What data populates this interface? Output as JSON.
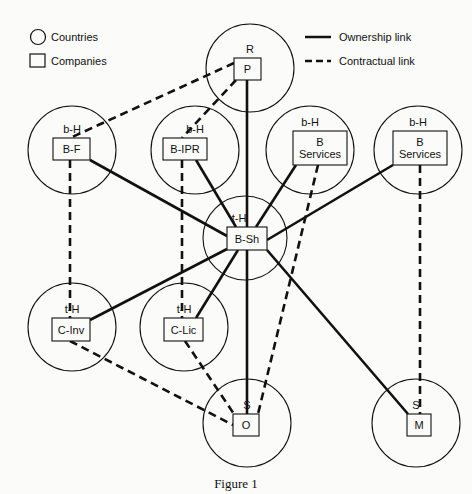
{
  "legend": {
    "countries": "Countries",
    "companies": "Companies",
    "ownership": "Ownership link",
    "contractual": "Contractual link"
  },
  "caption": "Figure 1",
  "nodes": [
    {
      "id": "P",
      "country": "R",
      "label": [
        "P"
      ],
      "cx": 250,
      "cy": 68,
      "r": 44,
      "bx": 234,
      "by": 58,
      "bw": 27,
      "bh": 22
    },
    {
      "id": "B-F",
      "country": "b-H",
      "label": [
        "B-F"
      ],
      "cx": 72,
      "cy": 150,
      "r": 44,
      "bx": 53,
      "by": 138,
      "bw": 37,
      "bh": 22
    },
    {
      "id": "B-IPR",
      "country": "b-H",
      "label": [
        "B-IPR"
      ],
      "cx": 195,
      "cy": 150,
      "r": 44,
      "bx": 163,
      "by": 138,
      "bw": 44,
      "bh": 22
    },
    {
      "id": "B-Services-1",
      "country": "b-H",
      "label": [
        "B",
        "Services"
      ],
      "cx": 310,
      "cy": 150,
      "r": 44,
      "bx": 293,
      "by": 131,
      "bw": 54,
      "bh": 34
    },
    {
      "id": "B-Services-2",
      "country": "b-H",
      "label": [
        "B",
        "Services"
      ],
      "cx": 418,
      "cy": 150,
      "r": 44,
      "bx": 393,
      "by": 131,
      "bw": 54,
      "bh": 34
    },
    {
      "id": "B-Sh",
      "country": "t-H",
      "label": [
        "B-Sh"
      ],
      "cx": 245,
      "cy": 238,
      "r": 42,
      "bx": 227,
      "by": 227,
      "bw": 40,
      "bh": 23
    },
    {
      "id": "C-Inv",
      "country": "t-H",
      "label": [
        "C-Inv"
      ],
      "cx": 72,
      "cy": 327,
      "r": 44,
      "bx": 52,
      "by": 318,
      "bw": 38,
      "bh": 23
    },
    {
      "id": "C-Lic",
      "country": "t-H",
      "label": [
        "C-Lic"
      ],
      "cx": 184,
      "cy": 327,
      "r": 44,
      "bx": 164,
      "by": 318,
      "bw": 39,
      "bh": 23
    },
    {
      "id": "O",
      "country": "S",
      "label": [
        "O"
      ],
      "cx": 247,
      "cy": 423,
      "r": 44,
      "bx": 233,
      "by": 414,
      "bw": 26,
      "bh": 22
    },
    {
      "id": "M",
      "country": "S",
      "label": [
        "M"
      ],
      "cx": 416,
      "cy": 423,
      "r": 44,
      "bx": 407,
      "by": 414,
      "bw": 24,
      "bh": 22
    }
  ],
  "links": [
    {
      "type": "ownership",
      "from": "P",
      "to": "B-Sh",
      "x1": 247,
      "y1": 80,
      "x2": 247,
      "y2": 227
    },
    {
      "type": "ownership",
      "from": "B-Sh",
      "to": "B-F",
      "x1": 227,
      "y1": 236,
      "x2": 90,
      "y2": 160
    },
    {
      "type": "ownership",
      "from": "B-Sh",
      "to": "B-IPR",
      "x1": 236,
      "y1": 227,
      "x2": 196,
      "y2": 160
    },
    {
      "type": "ownership",
      "from": "B-Sh",
      "to": "B-Services-1",
      "x1": 256,
      "y1": 227,
      "x2": 296,
      "y2": 165
    },
    {
      "type": "ownership",
      "from": "B-Sh",
      "to": "B-Services-2",
      "x1": 267,
      "y1": 240,
      "x2": 393,
      "y2": 165
    },
    {
      "type": "ownership",
      "from": "B-Sh",
      "to": "C-Inv",
      "x1": 227,
      "y1": 249,
      "x2": 90,
      "y2": 320
    },
    {
      "type": "ownership",
      "from": "B-Sh",
      "to": "C-Lic",
      "x1": 238,
      "y1": 250,
      "x2": 196,
      "y2": 318
    },
    {
      "type": "ownership",
      "from": "B-Sh",
      "to": "O",
      "x1": 247,
      "y1": 250,
      "x2": 247,
      "y2": 414
    },
    {
      "type": "ownership",
      "from": "B-Sh",
      "to": "M",
      "x1": 267,
      "y1": 250,
      "x2": 408,
      "y2": 414
    },
    {
      "type": "contractual",
      "from": "P",
      "to": "B-F",
      "x1": 234,
      "y1": 63,
      "x2": 70,
      "y2": 138
    },
    {
      "type": "contractual",
      "from": "P",
      "to": "B-IPR",
      "x1": 236,
      "y1": 80,
      "x2": 182,
      "y2": 138
    },
    {
      "type": "contractual",
      "from": "B-F",
      "to": "C-Inv",
      "x1": 70,
      "y1": 160,
      "x2": 70,
      "y2": 318
    },
    {
      "type": "contractual",
      "from": "B-IPR",
      "to": "C-Lic",
      "x1": 182,
      "y1": 160,
      "x2": 182,
      "y2": 318
    },
    {
      "type": "contractual",
      "from": "B-Services-1",
      "to": "O",
      "x1": 318,
      "y1": 165,
      "x2": 258,
      "y2": 414
    },
    {
      "type": "contractual",
      "from": "B-Services-2",
      "to": "M",
      "x1": 420,
      "y1": 165,
      "x2": 420,
      "y2": 414
    },
    {
      "type": "contractual",
      "from": "C-Inv",
      "to": "O",
      "x1": 70,
      "y1": 341,
      "x2": 233,
      "y2": 425
    },
    {
      "type": "contractual",
      "from": "C-Lic",
      "to": "O",
      "x1": 185,
      "y1": 341,
      "x2": 234,
      "y2": 414
    }
  ]
}
